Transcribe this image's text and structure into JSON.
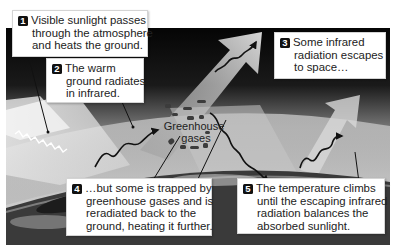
{
  "diagram": {
    "type": "greenhouse-effect-illustration",
    "colors": {
      "space": "#0a0a0a",
      "sky_light": "#c9c9c9",
      "earth_dark": "#2c2c2c",
      "callout_bg": "#ffffff",
      "number_badge": "#111111"
    },
    "center_label": {
      "line1": "Greenhouse",
      "line2": "gases"
    },
    "steps": [
      {
        "number": "1",
        "lines": [
          "Visible sunlight passes",
          "through the atmosphere",
          "and heats the ground."
        ]
      },
      {
        "number": "2",
        "lines": [
          "The warm",
          "ground radiates",
          "in infrared."
        ]
      },
      {
        "number": "3",
        "lines": [
          "Some infrared",
          "radiation escapes",
          "to space…"
        ]
      },
      {
        "number": "4",
        "lines": [
          "…but some is trapped by",
          "greenhouse gases and is",
          "reradiated back to the",
          "ground, heating it further."
        ]
      },
      {
        "number": "5",
        "lines": [
          "The temperature climbs",
          "until the escaping infrared",
          "radiation balances the",
          "absorbed sunlight."
        ]
      }
    ]
  }
}
